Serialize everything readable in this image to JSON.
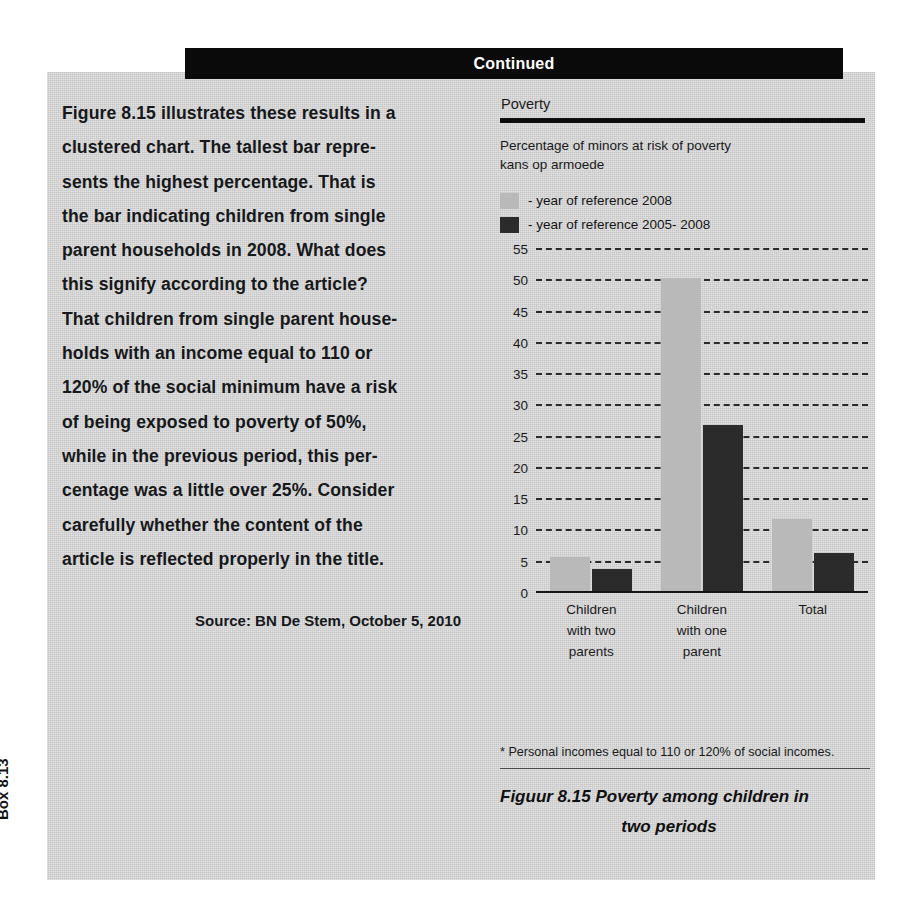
{
  "banner": {
    "label": "Continued"
  },
  "box_label": "Box 8.13",
  "body": {
    "lines": [
      "Figure 8.15 illustrates these results in a",
      "clustered chart. The tallest bar repre-",
      "sents the highest percentage. That is",
      "the bar indicating children from single",
      "parent households in 2008. What does",
      "this signify according to the article?",
      "That children from single parent house-",
      "holds with an income equal to 110 or",
      "120% of the social minimum have a risk",
      "of being exposed to poverty of 50%,",
      "while in the previous period, this per-",
      "centage was a little over 25%. Consider",
      "carefully whether the content of the",
      "article is reflected properly in the title."
    ],
    "source": "Source: BN De Stem, October 5, 2010"
  },
  "figure": {
    "footnote": "* Personal incomes equal to 110 or 120% of social incomes.",
    "caption_number": "Figuur 8.15",
    "caption_line1": "Figuur 8.15  Poverty among children in",
    "caption_line2": "two periods"
  },
  "chart_data": {
    "type": "bar",
    "title": "Poverty",
    "subtitle_line1": "Percentage of minors at risk of poverty",
    "subtitle_line2": "kans op armoede",
    "categories": [
      "Children with two parents",
      "Children with one parent",
      "Total"
    ],
    "category_lines": [
      [
        "Children",
        "with two",
        "parents"
      ],
      [
        "Children",
        "with one",
        "parent"
      ],
      [
        "Total",
        "",
        ""
      ]
    ],
    "series": [
      {
        "name": "- year of reference 2008",
        "color": "#b9b9b9",
        "values": [
          5.5,
          50,
          11.5
        ]
      },
      {
        "name": "- year of reference 2005- 2008",
        "color": "#2b2b2b",
        "values": [
          3.5,
          26.5,
          6
        ]
      }
    ],
    "xlabel": "",
    "ylabel": "",
    "ylim": [
      0,
      55
    ],
    "yticks": [
      0,
      5,
      10,
      15,
      20,
      25,
      30,
      35,
      40,
      45,
      50,
      55
    ],
    "grid": true,
    "grid_style": "dashed",
    "legend_position": "top-left"
  }
}
